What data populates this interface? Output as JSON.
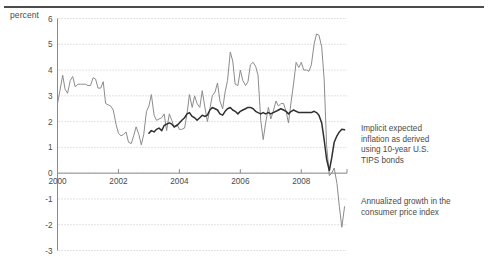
{
  "figure": {
    "unit_label": "percent",
    "top_rule_color": "#4c4c4c",
    "background": "#ffffff"
  },
  "annotations": [
    {
      "id": "tips",
      "text": "Implicit expected\ninflation as derived\nusing 10-year U.S.\nTIPS bonds",
      "series_ref": "Implicit expected inflation as derived using 10-year U.S. TIPS bonds"
    },
    {
      "id": "cpi",
      "text": "Annualized growth in the\nconsumer price index",
      "series_ref": "Annualized growth in the consumer price index"
    }
  ],
  "chart_data": {
    "type": "line",
    "title": "",
    "subtitle": "",
    "xlabel": "",
    "ylabel": "percent",
    "xlim": [
      2000.0,
      2009.5
    ],
    "ylim": [
      -3,
      6
    ],
    "yticks": [
      6,
      5,
      4,
      3,
      2,
      1,
      0,
      -1,
      -2,
      -3
    ],
    "ytick_labels": [
      "6",
      "5",
      "4",
      "3",
      "2",
      "1",
      "0",
      "-1",
      "-2",
      "-3"
    ],
    "xticks": [
      2000,
      2002,
      2004,
      2006,
      2008
    ],
    "xtick_labels": [
      "2000",
      "2002",
      "2004",
      "2006",
      "2008"
    ],
    "grid": "horizontal-dotted",
    "grid_color": "#b9b9b9",
    "axis_color": "#8a8a8a",
    "zero_axis_at": 0,
    "legend": "inline-annotations",
    "legend_position": "right",
    "series": [
      {
        "name": "Annualized growth in the consumer price index",
        "color": "#8c8c8c",
        "width": 1.0,
        "x": [
          2000.0,
          2000.08,
          2000.17,
          2000.25,
          2000.33,
          2000.42,
          2000.5,
          2000.58,
          2000.67,
          2000.75,
          2000.83,
          2000.92,
          2001.0,
          2001.08,
          2001.17,
          2001.25,
          2001.33,
          2001.42,
          2001.5,
          2001.58,
          2001.67,
          2001.75,
          2001.83,
          2001.92,
          2002.0,
          2002.08,
          2002.17,
          2002.25,
          2002.33,
          2002.42,
          2002.5,
          2002.58,
          2002.67,
          2002.75,
          2002.83,
          2002.92,
          2003.0,
          2003.08,
          2003.17,
          2003.25,
          2003.33,
          2003.42,
          2003.5,
          2003.58,
          2003.67,
          2003.75,
          2003.83,
          2003.92,
          2004.0,
          2004.08,
          2004.17,
          2004.25,
          2004.33,
          2004.42,
          2004.5,
          2004.58,
          2004.67,
          2004.75,
          2004.83,
          2004.92,
          2005.0,
          2005.08,
          2005.17,
          2005.25,
          2005.33,
          2005.42,
          2005.5,
          2005.58,
          2005.67,
          2005.75,
          2005.83,
          2005.92,
          2006.0,
          2006.08,
          2006.17,
          2006.25,
          2006.33,
          2006.42,
          2006.5,
          2006.58,
          2006.67,
          2006.75,
          2006.83,
          2006.92,
          2007.0,
          2007.08,
          2007.17,
          2007.25,
          2007.33,
          2007.42,
          2007.5,
          2007.58,
          2007.67,
          2007.75,
          2007.83,
          2007.92,
          2008.0,
          2008.08,
          2008.17,
          2008.25,
          2008.33,
          2008.42,
          2008.5,
          2008.58,
          2008.67,
          2008.75,
          2008.83,
          2008.92,
          2009.0,
          2009.08,
          2009.17,
          2009.25,
          2009.33,
          2009.42
        ],
        "values": [
          2.7,
          3.2,
          3.8,
          3.25,
          3.1,
          3.6,
          3.75,
          3.35,
          3.45,
          3.45,
          3.45,
          3.45,
          3.4,
          3.4,
          3.7,
          3.65,
          3.3,
          3.3,
          3.55,
          2.7,
          2.65,
          2.6,
          2.45,
          1.9,
          1.55,
          1.45,
          1.5,
          1.6,
          1.2,
          1.15,
          1.45,
          1.8,
          1.5,
          1.1,
          1.5,
          2.4,
          2.6,
          3.05,
          2.25,
          2.05,
          2.1,
          2.15,
          2.3,
          1.65,
          2.3,
          2.05,
          1.75,
          1.9,
          1.7,
          1.7,
          1.75,
          2.3,
          3.05,
          2.55,
          3.0,
          2.7,
          2.55,
          3.2,
          2.6,
          2.0,
          2.5,
          3.0,
          3.15,
          3.5,
          2.8,
          2.5,
          3.15,
          3.6,
          4.7,
          4.35,
          3.45,
          3.4,
          4.0,
          3.6,
          3.4,
          3.55,
          4.2,
          4.3,
          4.15,
          3.8,
          2.05,
          1.3,
          1.95,
          2.55,
          2.1,
          2.4,
          2.8,
          2.6,
          2.7,
          2.7,
          2.4,
          1.95,
          2.8,
          3.5,
          4.3,
          4.1,
          4.3,
          4.0,
          4.0,
          3.95,
          4.2,
          5.0,
          5.4,
          5.35,
          4.9,
          3.65,
          1.1,
          -0.1,
          0.0,
          0.2,
          -0.4,
          -1.3,
          -2.1,
          -1.3
        ]
      },
      {
        "name": "Implicit expected inflation as derived using 10-year U.S. TIPS bonds",
        "color": "#2f2f2f",
        "width": 1.5,
        "x": [
          2003.0,
          2003.08,
          2003.17,
          2003.25,
          2003.33,
          2003.42,
          2003.5,
          2003.58,
          2003.67,
          2003.75,
          2003.83,
          2003.92,
          2004.0,
          2004.08,
          2004.17,
          2004.25,
          2004.33,
          2004.42,
          2004.5,
          2004.58,
          2004.67,
          2004.75,
          2004.83,
          2004.92,
          2005.0,
          2005.08,
          2005.17,
          2005.25,
          2005.33,
          2005.42,
          2005.5,
          2005.58,
          2005.67,
          2005.75,
          2005.83,
          2005.92,
          2006.0,
          2006.08,
          2006.17,
          2006.25,
          2006.33,
          2006.42,
          2006.5,
          2006.58,
          2006.67,
          2006.75,
          2006.83,
          2006.92,
          2007.0,
          2007.08,
          2007.17,
          2007.25,
          2007.33,
          2007.42,
          2007.5,
          2007.58,
          2007.67,
          2007.75,
          2007.83,
          2007.92,
          2008.0,
          2008.08,
          2008.17,
          2008.25,
          2008.33,
          2008.42,
          2008.5,
          2008.58,
          2008.67,
          2008.75,
          2008.83,
          2008.92,
          2009.0,
          2009.08,
          2009.17,
          2009.25,
          2009.33,
          2009.42
        ],
        "values": [
          1.55,
          1.65,
          1.6,
          1.7,
          1.75,
          1.65,
          1.85,
          1.9,
          1.95,
          1.9,
          1.8,
          1.85,
          1.95,
          2.05,
          2.15,
          2.3,
          2.35,
          2.2,
          2.15,
          2.05,
          2.15,
          2.25,
          2.2,
          2.25,
          2.45,
          2.55,
          2.5,
          2.45,
          2.3,
          2.25,
          2.4,
          2.5,
          2.55,
          2.45,
          2.4,
          2.3,
          2.4,
          2.45,
          2.5,
          2.55,
          2.55,
          2.5,
          2.4,
          2.35,
          2.3,
          2.35,
          2.3,
          2.35,
          2.3,
          2.35,
          2.4,
          2.45,
          2.5,
          2.45,
          2.4,
          2.3,
          2.4,
          2.45,
          2.4,
          2.35,
          2.35,
          2.35,
          2.35,
          2.35,
          2.35,
          2.4,
          2.35,
          2.25,
          1.95,
          1.3,
          0.55,
          0.1,
          0.6,
          1.2,
          1.45,
          1.6,
          1.7,
          1.68
        ]
      }
    ]
  }
}
